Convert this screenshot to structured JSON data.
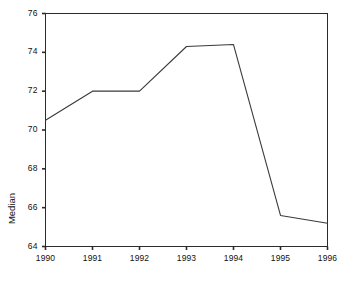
{
  "chart_data": {
    "type": "line",
    "title": "",
    "xlabel": "",
    "ylabel": "Median",
    "categories": [
      "1990",
      "1991",
      "1992",
      "1993",
      "1994",
      "1995",
      "1996"
    ],
    "x": [
      1990,
      1991,
      1992,
      1993,
      1994,
      1995,
      1996
    ],
    "values": [
      70.5,
      72.0,
      72.0,
      74.3,
      74.4,
      65.6,
      65.2
    ],
    "series": [
      {
        "name": "Median",
        "values": [
          70.5,
          72.0,
          72.0,
          74.3,
          74.4,
          65.6,
          65.2
        ]
      }
    ],
    "xlim": [
      1990,
      1996
    ],
    "ylim": [
      64,
      76
    ],
    "ytick_labels": [
      "64",
      "66",
      "68",
      "70",
      "72",
      "74",
      "76"
    ],
    "yticks": [
      64,
      66,
      68,
      70,
      72,
      74,
      76
    ],
    "xtick_labels": [
      "1990",
      "1991",
      "1992",
      "1993",
      "1994",
      "1995",
      "1996"
    ],
    "grid": false,
    "legend": "none",
    "line_color": "#3a3a3a",
    "axis_color": "#2b2b2b",
    "background_color": "#ffffff"
  },
  "axes": {
    "y_label_text": "Median"
  }
}
